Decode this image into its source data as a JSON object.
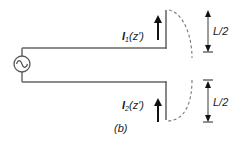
{
  "figure": {
    "caption": "(b)",
    "colors": {
      "line": "#555555",
      "arrow": "#111111",
      "dashed": "#777777",
      "background": "#ffffff"
    }
  },
  "source": {
    "symbol": "ac-voltage-source",
    "glyph": "~"
  },
  "currents": [
    {
      "name": "I",
      "subscript": "1",
      "argument": "(z′)",
      "direction": "up"
    },
    {
      "name": "I",
      "subscript": "2",
      "argument": "(z′)",
      "direction": "up"
    }
  ],
  "dimensions": [
    {
      "label": "L/2",
      "position": "upper-arm"
    },
    {
      "label": "L/2",
      "position": "lower-arm"
    }
  ]
}
